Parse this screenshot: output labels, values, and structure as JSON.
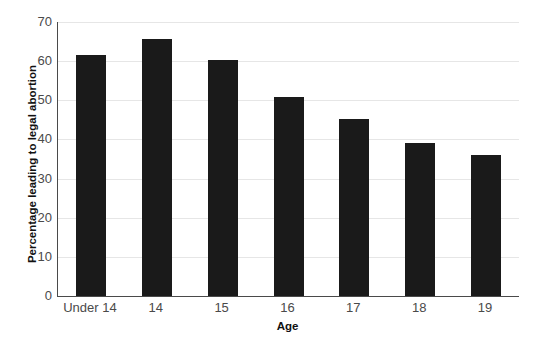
{
  "chart_data": {
    "type": "bar",
    "title": "",
    "categories": [
      "Under 14",
      "14",
      "15",
      "16",
      "17",
      "18",
      "19"
    ],
    "values": [
      61.5,
      65.7,
      60.2,
      50.8,
      45.3,
      39.2,
      35.9
    ],
    "xlabel": "Age",
    "ylabel": "Percentage leading to legal abortion",
    "ylim": [
      0,
      70
    ],
    "yticks": [
      0,
      10,
      20,
      30,
      40,
      50,
      60,
      70
    ],
    "ytick_labels": [
      "0",
      "10",
      "20",
      "30",
      "40",
      "50",
      "60",
      "70"
    ],
    "grid": true,
    "grid_axis": "y",
    "legend": false,
    "legend_position": "none",
    "bar_color": "#1a1a1a",
    "grid_color": "#e6e6e6",
    "axis_color": "#4a4a4a",
    "background_color": "#ffffff"
  },
  "axes": {
    "y_title": "Percentage leading to legal abortion",
    "x_title": "Age"
  }
}
